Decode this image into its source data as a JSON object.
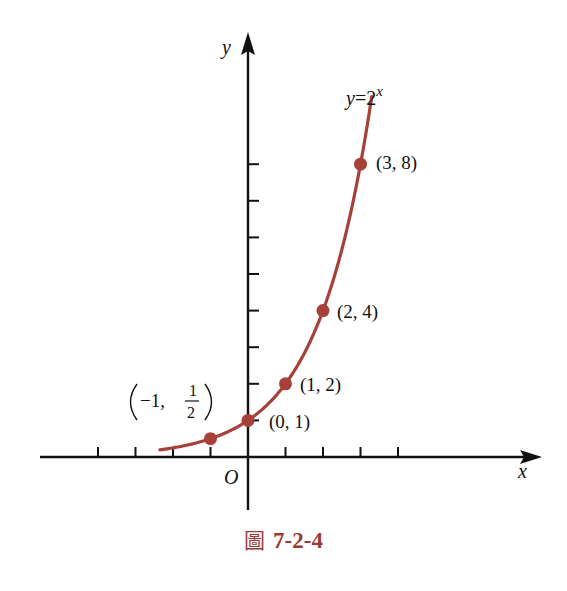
{
  "chart_data": {
    "type": "line",
    "title": "",
    "function_label": "y=2^x",
    "function_label_base": "y=2",
    "function_label_exponent": "x",
    "xlabel": "x",
    "ylabel": "y",
    "origin_label": "O",
    "xlim": [
      -5.5,
      7.8
    ],
    "ylim": [
      -1.5,
      11.4
    ],
    "x_ticks": [
      -4,
      -3,
      -2,
      -1,
      1,
      2,
      3,
      4
    ],
    "y_ticks": [
      1,
      2,
      3,
      4,
      5,
      6,
      7,
      8
    ],
    "grid": false,
    "legend": null,
    "curve": {
      "x_start": -2.35,
      "x_end": 3.3,
      "color": "#a8403a"
    },
    "points": [
      {
        "x": -1,
        "y": 0.5,
        "label": "(-1, 1/2)"
      },
      {
        "x": 0,
        "y": 1,
        "label": "(0, 1)"
      },
      {
        "x": 1,
        "y": 2,
        "label": "(1, 2)"
      },
      {
        "x": 2,
        "y": 4,
        "label": "(2, 4)"
      },
      {
        "x": 3,
        "y": 8,
        "label": "(3, 8)"
      }
    ]
  },
  "labels": {
    "point_neg1_prefix": "−1,",
    "point_neg1_num": "1",
    "point_neg1_den": "2",
    "point_0": "(0, 1)",
    "point_1": "(1, 2)",
    "point_2": "(2, 4)",
    "point_3": "(3, 8)"
  },
  "caption": {
    "glyph": "圖",
    "number": "7-2-4",
    "color": "#9b3a35"
  }
}
